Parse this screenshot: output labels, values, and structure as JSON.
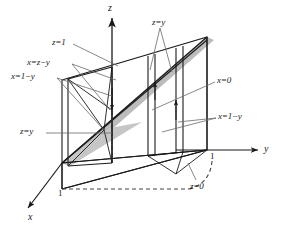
{
  "figure": {
    "type": "3d-math-diagram",
    "width": 287,
    "height": 233,
    "colors": {
      "line": "#1a1a1a",
      "leader": "#555555",
      "shade": "#b9b9b9",
      "background": "#ffffff",
      "text": "#1a1a1a"
    }
  },
  "axes": [
    {
      "key": "x",
      "label": "x",
      "tick": "1"
    },
    {
      "key": "y",
      "label": "y",
      "tick": "1"
    },
    {
      "key": "z",
      "label": "z",
      "tick": ""
    }
  ],
  "labels": {
    "z_axis": "z",
    "y_axis": "y",
    "x_axis": "x",
    "tick_y_one": "1",
    "tick_x_one": "1",
    "z_eq_1": "z=1",
    "x_eq_z_minus_y": "x=z−y",
    "x_eq_1_minus_y_left": "x=1−y",
    "z_eq_y_left": "z=y",
    "z_eq_y_top": "z=y",
    "x_eq_0": "x=0",
    "x_eq_1_minus_y_right": "x=1−y",
    "z_eq_0": "z=0"
  },
  "surfaces": [
    {
      "name": "z=1",
      "description": "top plane of the box"
    },
    {
      "name": "x=z-y",
      "description": "slanted bounding plane"
    },
    {
      "name": "x=1-y",
      "description": "front slanted plane"
    },
    {
      "name": "z=y",
      "description": "diagonal plane through origin"
    },
    {
      "name": "x=0",
      "description": "back vertical plane"
    },
    {
      "name": "z=0",
      "description": "bottom plane"
    }
  ]
}
